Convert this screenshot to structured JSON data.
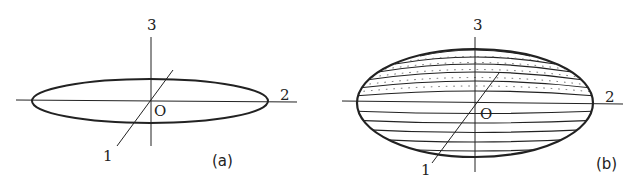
{
  "panels": [
    {
      "id": "a",
      "caption": "(a)",
      "shape": "flat oblate ellipsoid (disk-like, edge view)",
      "axis_labels": {
        "axis1": "1",
        "axis2": "2",
        "axis3": "3",
        "origin": "O"
      }
    },
    {
      "id": "b",
      "caption": "(b)",
      "shape": "oblate spheroid with horizontal contour bands (dotted on upper half)",
      "axis_labels": {
        "axis1": "1",
        "axis2": "2",
        "axis3": "3",
        "origin": "O"
      }
    }
  ],
  "colors": {
    "stroke": "#222222",
    "background": "#ffffff"
  }
}
